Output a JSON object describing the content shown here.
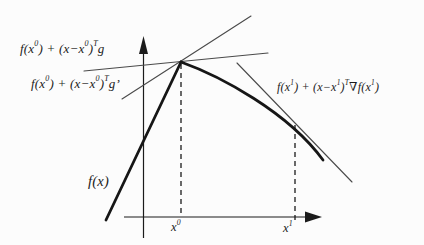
{
  "figure": {
    "labels": {
      "subgradient_g": "f(x^0) + (x−x^0)^Tg",
      "subgradient_g_prime": "f(x^0) + (x−x^0)^Tg’",
      "tangent_x1": "f(x^1) + (x−x^1)^T∇f(x^1)",
      "function": "f(x)",
      "x0_tick": "x^0",
      "x1_tick": "x^1"
    },
    "colors": {
      "paper": "#fcfcfc",
      "ink": "#1b1b1b",
      "curve": "#161616",
      "thin_line": "#4a4a4a"
    }
  }
}
